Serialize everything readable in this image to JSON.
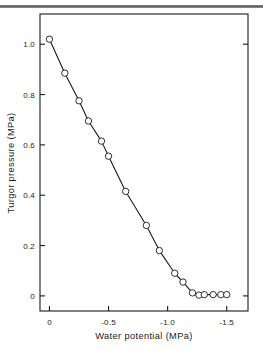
{
  "figure": {
    "background_color": "#ffffff",
    "ink_color": "#1a1a1a",
    "top_rule_color": "#6e6e6e",
    "frame": {
      "visible": true,
      "sides": [
        "left",
        "right",
        "top",
        "bottom"
      ]
    }
  },
  "chart_data": {
    "type": "line",
    "title": "",
    "subtitle": "",
    "xlabel": "Water potential (MPa)",
    "ylabel": "Turgor pressure (MPa)",
    "xlim": [
      0.08,
      -1.68
    ],
    "ylim": [
      -0.06,
      1.12
    ],
    "x_ticks": [
      0,
      -0.5,
      -1.0,
      -1.5
    ],
    "x_tick_labels": [
      "0",
      "-0.5",
      "-1.0",
      "-1.5"
    ],
    "y_ticks": [
      0,
      0.2,
      0.4,
      0.6,
      0.8,
      1.0
    ],
    "y_tick_labels": [
      "0",
      "0.2",
      "0.4",
      "0.6",
      "0.8",
      "1.0"
    ],
    "grid": false,
    "legend": null,
    "marker": "open-circle",
    "marker_size": 3.2,
    "line_color": "#1a1a1a",
    "line_width": 1.1,
    "series": [
      {
        "name": "Turgor pressure vs water potential",
        "x": [
          0.0,
          -0.13,
          -0.25,
          -0.33,
          -0.44,
          -0.5,
          -0.645,
          -0.82,
          -0.93,
          -1.06,
          -1.13,
          -1.21,
          -1.265,
          -1.31,
          -1.385,
          -1.45,
          -1.5
        ],
        "y": [
          1.02,
          0.885,
          0.775,
          0.695,
          0.615,
          0.555,
          0.415,
          0.28,
          0.18,
          0.09,
          0.055,
          0.012,
          0.003,
          0.005,
          0.005,
          0.005,
          0.005
        ]
      }
    ],
    "annotations": []
  }
}
